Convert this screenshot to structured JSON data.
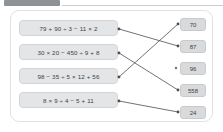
{
  "app": {
    "title": "Order of Operations Matching Exercise"
  },
  "top_strip": {
    "tab_label": ""
  },
  "exercise": {
    "expressions": [
      {
        "id": "expr-1",
        "text": "79 + 90 ÷ 3 − 11 × 2"
      },
      {
        "id": "expr-2",
        "text": "30 × 20 − 450 ÷ 9 + 8"
      },
      {
        "id": "expr-3",
        "text": "98 − 35 ÷ 5 × 12 + 56"
      },
      {
        "id": "expr-4",
        "text": "8 × 9 ÷ 4 − 5 + 11"
      }
    ],
    "answers": [
      {
        "id": "ans-1",
        "text": "70"
      },
      {
        "id": "ans-2",
        "text": "87"
      },
      {
        "id": "ans-3",
        "text": "96"
      },
      {
        "id": "ans-4",
        "text": "558"
      },
      {
        "id": "ans-5",
        "text": "24"
      }
    ],
    "connections": [
      {
        "from": "expr-1",
        "to": "ans-2"
      },
      {
        "from": "expr-2",
        "to": "ans-4"
      },
      {
        "from": "expr-3",
        "to": "ans-1"
      },
      {
        "from": "expr-4",
        "to": "ans-5"
      }
    ],
    "unconnected_answers": [
      "ans-3"
    ]
  },
  "colors": {
    "page_background": "#ffffff",
    "card_border": "#dfe1e4",
    "expression_fill": "#e4e5e7",
    "answer_fill": "#d9dadc",
    "text": "#3c3f43",
    "connector_line": "#4a4f54",
    "top_tab": "#8e9296"
  }
}
